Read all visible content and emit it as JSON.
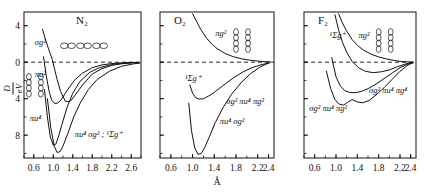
{
  "figure": {
    "y_axis_label_numerator": "D",
    "y_axis_label_denominator": "eV",
    "x_axis_unit": "Å"
  },
  "chart_data": {
    "type": "line",
    "xlabel": "Å",
    "ylabel": "D/eV",
    "grid": false,
    "legend": "none",
    "panels": [
      {
        "id": "n2",
        "title": "N₂",
        "xlim": [
          0.4,
          2.8
        ],
        "ylim": [
          -10.5,
          5.5
        ],
        "xticks": [
          0.6,
          1.0,
          1.4,
          1.8,
          2.2,
          2.6
        ],
        "xticklabels": [
          "0.6",
          "1.0",
          "1.4",
          "1.8",
          "2.2",
          "2.6"
        ],
        "yticks": [
          4,
          0,
          -4,
          -8
        ],
        "yticklabels": [
          "4",
          "0",
          "4",
          "8"
        ],
        "zero_line": true,
        "orbital_diagram": "three-horizontal-dumbbells",
        "annotations": [
          {
            "name": "sigma-g-2",
            "text": "σg²",
            "x": 0.62,
            "y": 1.9
          },
          {
            "name": "pi-u-2",
            "text": "πu²",
            "x": 0.62,
            "y": -1.6
          },
          {
            "name": "pi-u-4",
            "text": "πu⁴",
            "x": 0.52,
            "y": -6.4
          },
          {
            "name": "pi-u-4-sigma-g-2-state",
            "text": "πu⁴ σg² ; ¹Σg⁺",
            "x": 1.44,
            "y": -8.2
          }
        ],
        "series": [
          {
            "name": "sigma_g2",
            "x": [
              0.78,
              0.85,
              0.92,
              0.98,
              1.02,
              1.08,
              1.15,
              1.25,
              1.35,
              1.45,
              1.6,
              1.8,
              2.0,
              2.2,
              2.4,
              2.6,
              2.75
            ],
            "y": [
              3.6,
              2.3,
              1.2,
              0.3,
              -0.6,
              -1.9,
              -3.2,
              -4.3,
              -4.3,
              -3.6,
              -2.5,
              -1.3,
              -0.7,
              -0.35,
              -0.18,
              -0.08,
              -0.04
            ]
          },
          {
            "name": "pi_u2",
            "x": [
              0.8,
              0.86,
              0.92,
              0.97,
              1.02,
              1.08,
              1.15,
              1.25,
              1.35,
              1.45,
              1.6,
              1.8,
              2.0,
              2.2,
              2.4,
              2.6,
              2.75
            ],
            "y": [
              0.6,
              -1.6,
              -3.3,
              -4.2,
              -4.5,
              -4.5,
              -4.2,
              -3.4,
              -2.6,
              -1.9,
              -1.2,
              -0.6,
              -0.3,
              -0.15,
              -0.08,
              -0.04,
              -0.02
            ]
          },
          {
            "name": "pi_u4",
            "x": [
              0.82,
              0.88,
              0.94,
              1.0,
              1.05,
              1.1,
              1.18,
              1.28,
              1.4,
              1.55,
              1.75,
              1.95,
              2.2,
              2.45,
              2.7
            ],
            "y": [
              -3.0,
              -6.0,
              -8.2,
              -9.1,
              -9.0,
              -8.3,
              -6.8,
              -5.0,
              -3.4,
              -2.1,
              -1.1,
              -0.6,
              -0.25,
              -0.1,
              -0.04
            ]
          },
          {
            "name": "pi_u4_sigma_g2",
            "x": [
              0.88,
              0.95,
              1.02,
              1.08,
              1.14,
              1.2,
              1.3,
              1.42,
              1.55,
              1.72,
              1.9,
              2.15,
              2.4,
              2.65,
              2.78
            ],
            "y": [
              -4.0,
              -7.2,
              -9.2,
              -9.9,
              -9.8,
              -9.2,
              -7.8,
              -6.0,
              -4.5,
              -3.0,
              -1.9,
              -1.0,
              -0.45,
              -0.18,
              -0.1
            ]
          }
        ]
      },
      {
        "id": "o2",
        "title": "O₂",
        "xlim": [
          0.4,
          2.5
        ],
        "ylim": [
          -10.5,
          5.5
        ],
        "xticks": [
          0.6,
          1.0,
          1.4,
          1.8,
          2.2,
          2.4
        ],
        "xticklabels": [
          "0.6",
          "1.0",
          "1.4",
          "1.8",
          "2.2",
          "2.4"
        ],
        "yticks": [
          4,
          0,
          -4,
          -8
        ],
        "yticklabels": [
          "",
          "",
          "",
          ""
        ],
        "zero_line": true,
        "orbital_diagram": "four-vertical-dumbbells",
        "annotations": [
          {
            "name": "pi-g-2",
            "text": "πg²",
            "x": 1.42,
            "y": 2.9
          },
          {
            "name": "sigma-g-state",
            "text": "¹Σg⁺",
            "x": 0.86,
            "y": -2.1
          },
          {
            "name": "sigma-g-2-pi-u-4-pi-g-2",
            "text": "σg² πu⁴ πg²",
            "x": 1.62,
            "y": -4.6
          },
          {
            "name": "pi-u-4-sigma-g-2",
            "text": "πu⁴ σg²",
            "x": 1.5,
            "y": -6.8
          }
        ],
        "series": [
          {
            "name": "pi_g2",
            "x": [
              1.0,
              1.08,
              1.15,
              1.25,
              1.35,
              1.45,
              1.6,
              1.75,
              1.9,
              2.05,
              2.2,
              2.35,
              2.45
            ],
            "y": [
              5.3,
              4.4,
              3.6,
              2.7,
              2.0,
              1.5,
              0.95,
              0.6,
              0.38,
              0.22,
              0.12,
              0.05,
              0.02
            ]
          },
          {
            "name": "sigma_g_1state",
            "x": [
              0.95,
              1.0,
              1.06,
              1.12,
              1.2,
              1.3,
              1.4,
              1.5,
              1.62,
              1.78,
              1.95,
              2.12,
              2.28,
              2.42
            ],
            "y": [
              -2.5,
              -3.4,
              -3.9,
              -4.05,
              -4.0,
              -3.7,
              -3.3,
              -2.85,
              -2.3,
              -1.6,
              -1.0,
              -0.55,
              -0.25,
              -0.07
            ]
          },
          {
            "name": "pi_u4_sigma_g2",
            "x": [
              0.93,
              0.98,
              1.04,
              1.1,
              1.16,
              1.22,
              1.3,
              1.42,
              1.56,
              1.72,
              1.9,
              2.08,
              2.25,
              2.4
            ],
            "y": [
              -4.5,
              -7.5,
              -9.4,
              -10.1,
              -10.0,
              -9.4,
              -8.3,
              -6.6,
              -5.0,
              -3.5,
              -2.2,
              -1.2,
              -0.5,
              -0.1
            ]
          }
        ]
      },
      {
        "id": "f2",
        "title": "F₂",
        "xlim": [
          0.4,
          2.5
        ],
        "ylim": [
          -10.5,
          5.5
        ],
        "xticks": [
          0.6,
          1.0,
          1.4,
          1.8,
          2.2,
          2.4
        ],
        "xticklabels": [
          "0.6",
          "1.0",
          "1.4",
          "1.8",
          "2.2",
          "2.4"
        ],
        "yticks": [
          4,
          0,
          -4,
          -8
        ],
        "yticklabels": [
          "",
          "",
          "",
          ""
        ],
        "zero_line": true,
        "orbital_diagram": "four-vertical-dumbbells",
        "annotations": [
          {
            "name": "sigma-g-state",
            "text": "¹Σg⁺",
            "x": 0.88,
            "y": 2.6
          },
          {
            "name": "pi-g-2",
            "text": "πg²",
            "x": 1.42,
            "y": 2.7
          },
          {
            "name": "sigma-g-2-pi-u-4-pi-g-4",
            "text": "σg² πu⁴ πg⁴",
            "x": 1.62,
            "y": -3.4
          },
          {
            "name": "sigma-g-2-pi-u-4-pi-g-2",
            "text": "σg² πu⁴ πg²",
            "x": 0.5,
            "y": -5.4
          }
        ],
        "series": [
          {
            "name": "pi_g2_upper",
            "x": [
              1.05,
              1.12,
              1.2,
              1.3,
              1.4,
              1.52,
              1.65,
              1.8,
              1.95,
              2.1,
              2.22,
              2.35,
              2.45
            ],
            "y": [
              5.3,
              4.3,
              3.4,
              2.5,
              1.85,
              1.3,
              0.9,
              0.58,
              0.35,
              0.18,
              0.08,
              0.03,
              0.01
            ]
          },
          {
            "name": "sigma_g_1state",
            "x": [
              0.98,
              1.05,
              1.12,
              1.2,
              1.3,
              1.42,
              1.55,
              1.7,
              1.85,
              2.0,
              2.15,
              2.3,
              2.42
            ],
            "y": [
              5.2,
              3.5,
              2.2,
              1.1,
              0.1,
              -0.6,
              -1.0,
              -1.15,
              -1.05,
              -0.85,
              -0.5,
              -0.2,
              -0.05
            ]
          },
          {
            "name": "sigma_g2_pi_u4_pi_g4",
            "x": [
              0.92,
              1.0,
              1.08,
              1.16,
              1.25,
              1.36,
              1.48,
              1.6,
              1.75,
              1.9,
              2.05,
              2.2,
              2.35,
              2.45
            ],
            "y": [
              0.5,
              -1.6,
              -2.6,
              -3.1,
              -3.3,
              -3.35,
              -3.2,
              -2.9,
              -2.4,
              -1.8,
              -1.2,
              -0.6,
              -0.2,
              -0.05
            ]
          },
          {
            "name": "sigma_g2_pi_u4_pi_g2",
            "x": [
              0.82,
              0.9,
              0.98,
              1.06,
              1.14,
              1.22,
              1.3,
              1.4,
              1.5,
              1.62,
              1.75,
              1.9,
              2.05,
              2.2,
              2.35,
              2.45
            ],
            "y": [
              -1.0,
              -2.9,
              -4.1,
              -4.6,
              -4.7,
              -4.4,
              -4.1,
              -4.35,
              -4.45,
              -4.2,
              -3.6,
              -2.8,
              -1.9,
              -1.0,
              -0.3,
              -0.05
            ]
          }
        ]
      }
    ]
  }
}
